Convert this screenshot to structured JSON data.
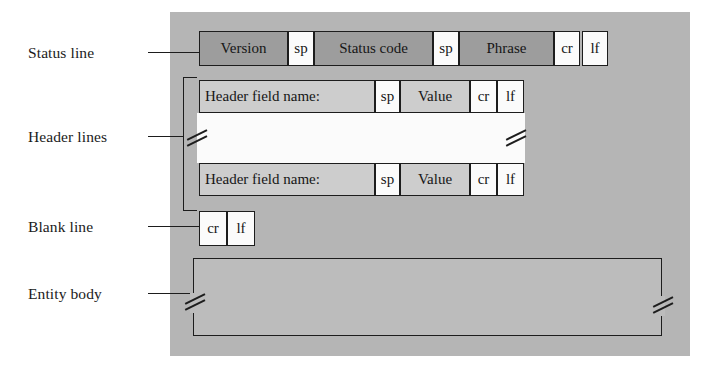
{
  "diagram": {
    "background_color": "#b5b5b5",
    "status_line_color": "#9d9d9d",
    "header_line_color": "#cdcdcd",
    "special_char_color": "#fbfbfb",
    "entity_body_color": "#bcbcbc",
    "outline_color": "#1d1d1d"
  },
  "labels": {
    "status_line": "Status line",
    "header_lines": "Header lines",
    "blank_line": "Blank line",
    "entity_body": "Entity body"
  },
  "status_line": {
    "cells": [
      {
        "text": "Version",
        "kind": "field"
      },
      {
        "text": "sp",
        "kind": "special"
      },
      {
        "text": "Status code",
        "kind": "field"
      },
      {
        "text": "sp",
        "kind": "special"
      },
      {
        "text": "Phrase",
        "kind": "field"
      },
      {
        "text": "cr",
        "kind": "special"
      },
      {
        "text": "lf",
        "kind": "special"
      }
    ]
  },
  "header_line_first": {
    "cells": [
      {
        "text": "Header field name:",
        "kind": "field"
      },
      {
        "text": "sp",
        "kind": "special"
      },
      {
        "text": "Value",
        "kind": "field"
      },
      {
        "text": "cr",
        "kind": "special"
      },
      {
        "text": "lf",
        "kind": "special"
      }
    ]
  },
  "header_line_last": {
    "cells": [
      {
        "text": "Header field name:",
        "kind": "field"
      },
      {
        "text": "sp",
        "kind": "special"
      },
      {
        "text": "Value",
        "kind": "field"
      },
      {
        "text": "cr",
        "kind": "special"
      },
      {
        "text": "lf",
        "kind": "special"
      }
    ]
  },
  "blank_line": {
    "cells": [
      {
        "text": "cr",
        "kind": "special"
      },
      {
        "text": "lf",
        "kind": "special"
      }
    ]
  },
  "entity_body": {
    "text": "",
    "break_marks": 2
  },
  "header_gap": {
    "break_marks": 2,
    "text": ""
  }
}
